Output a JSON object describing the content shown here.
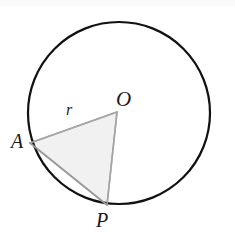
{
  "figure": {
    "name": "circle-with-inscribed-triangle",
    "background_color": "#ffffff",
    "width": 235,
    "height": 236
  },
  "circle": {
    "name": "main-circle",
    "center_x": 119,
    "center_y": 113,
    "radius": 91,
    "stroke_color": "#111111",
    "stroke_width": 2.2,
    "fill": "none"
  },
  "triangle": {
    "name": "shaded-triangle-OAP",
    "fill_color": "#f1f1f1",
    "stroke_color": "#a9a9a9",
    "stroke_width": 1.6,
    "vertices": [
      {
        "label": "O",
        "x": 117,
        "y": 112
      },
      {
        "label": "A",
        "x": 30,
        "y": 143
      },
      {
        "label": "P",
        "x": 107,
        "y": 205
      }
    ]
  },
  "labels": {
    "center": "O",
    "point_a": "A",
    "point_p": "P",
    "radius": "r"
  },
  "chart_data": {
    "type": "diagram",
    "title": "",
    "shapes": [
      {
        "kind": "circle",
        "center": [
          119,
          113
        ],
        "radius": 91,
        "stroke": "#111111",
        "fill": "none"
      },
      {
        "kind": "polygon",
        "points": [
          [
            117,
            112
          ],
          [
            30,
            143
          ],
          [
            107,
            205
          ]
        ],
        "stroke": "#a9a9a9",
        "fill": "#f1f1f1"
      }
    ],
    "annotations": [
      {
        "text": "O",
        "x": 126,
        "y": 100,
        "role": "circle-center-label"
      },
      {
        "text": "A",
        "x": 19,
        "y": 141,
        "role": "point-on-circle-label"
      },
      {
        "text": "P",
        "x": 104,
        "y": 220,
        "role": "point-on-circle-label"
      },
      {
        "text": "r",
        "x": 71,
        "y": 110,
        "role": "radius-length-label"
      }
    ]
  }
}
